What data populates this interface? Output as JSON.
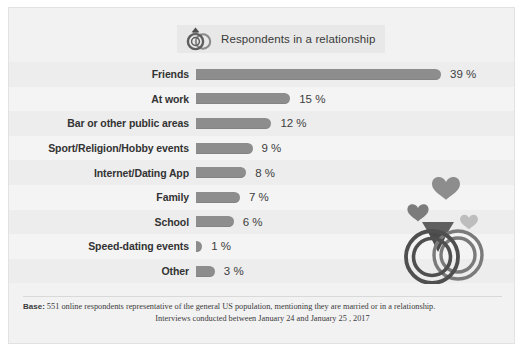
{
  "legend": {
    "icon": "wedding-rings-icon",
    "label": "Respondents in a relationship"
  },
  "chart_data": {
    "type": "bar",
    "orientation": "horizontal",
    "title": "",
    "xlabel": "",
    "ylabel": "",
    "xlim": [
      0,
      39
    ],
    "grid": false,
    "legend_position": "top-center",
    "unit": "%",
    "categories": [
      "Friends",
      "At work",
      "Bar or other public areas",
      "Sport/Religion/Hobby events",
      "Internet/Dating App",
      "Family",
      "School",
      "Speed-dating events",
      "Other"
    ],
    "values": [
      39,
      15,
      12,
      9,
      8,
      7,
      6,
      1,
      3
    ],
    "value_labels": [
      "39 %",
      "15 %",
      "12 %",
      "9 %",
      "8 %",
      "7 %",
      "6 %",
      "1 %",
      "3 %"
    ],
    "series": [
      {
        "name": "Respondents in a relationship",
        "values": [
          39,
          15,
          12,
          9,
          8,
          7,
          6,
          1,
          3
        ]
      }
    ]
  },
  "footer": {
    "base_label": "Base:",
    "line1": " 551 online respondents representative of the general US population, mentioning they are married or in a relationship.",
    "line2": "Interviews conducted between January 24  and January 25 , 2017"
  },
  "colors": {
    "bar": "#8d8d8d",
    "card_background": "#f2f2f2",
    "row_odd": "#ededed",
    "row_even": "#f4f4f4",
    "text": "#333333",
    "art_dark": "#6e6e6e",
    "art_light": "#b5b5b5"
  },
  "decoration": {
    "art": "wedding-rings-with-hearts-illustration"
  }
}
